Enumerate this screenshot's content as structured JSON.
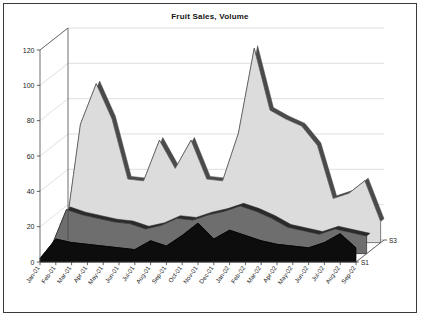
{
  "chart": {
    "title": "Fruit Sales, Volume",
    "frame_border_color": "#3a3a3a",
    "background_color": "#ffffff"
  },
  "axes": {
    "y_ticks": [
      "0",
      "20",
      "40",
      "60",
      "80",
      "100",
      "120"
    ],
    "depth_ticks": [
      "S1",
      "S3"
    ]
  },
  "chart_data": {
    "type": "area",
    "title": "Fruit Sales, Volume",
    "subtitle": "",
    "xlabel": "",
    "ylabel": "",
    "zlabel": "",
    "ylim": [
      0,
      120
    ],
    "ytick_values": [
      0,
      20,
      40,
      60,
      80,
      100,
      120
    ],
    "grid": true,
    "legend_position": "none",
    "projection": "3d-depth-area",
    "depth_axis_labels": [
      "S1",
      "S3"
    ],
    "categories": [
      "Jan-01",
      "Feb-01",
      "Mar-01",
      "Apr-01",
      "May-01",
      "Jun-01",
      "Jul-01",
      "Aug-01",
      "Sep-01",
      "Oct-01",
      "Nov-01",
      "Dec-01",
      "Jan-02",
      "Feb-02",
      "Mar-02",
      "Apr-02",
      "May-02",
      "Jun-02",
      "Jul-02",
      "Aug-02",
      "Sep-02"
    ],
    "series": [
      {
        "name": "S3",
        "depth_index": 2,
        "color": "#dcdcdc",
        "edge_color": "#4a4a4a",
        "values": [
          2,
          67,
          90,
          70,
          36,
          35,
          58,
          42,
          58,
          36,
          35,
          62,
          110,
          75,
          70,
          66,
          55,
          25,
          28,
          35,
          12
        ]
      },
      {
        "name": "S2",
        "depth_index": 1,
        "color": "#6e6e6e",
        "edge_color": "#2a2a2a",
        "values": [
          3,
          25,
          22,
          20,
          18,
          17,
          14,
          16,
          20,
          19,
          22,
          24,
          27,
          24,
          20,
          15,
          13,
          11,
          14,
          12,
          10
        ]
      },
      {
        "name": "S1",
        "depth_index": 0,
        "color": "#0d0d0d",
        "edge_color": "#000000",
        "values": [
          2,
          13,
          11,
          10,
          9,
          8,
          7,
          12,
          9,
          15,
          22,
          13,
          18,
          15,
          12,
          10,
          9,
          8,
          11,
          16,
          8
        ]
      }
    ]
  }
}
